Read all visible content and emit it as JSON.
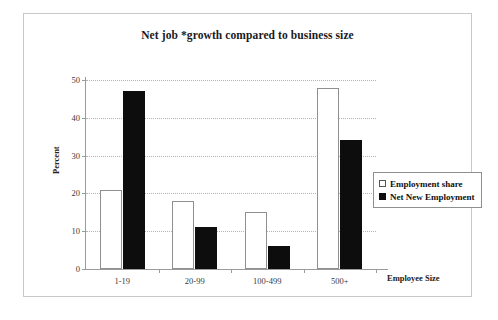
{
  "chart_data": {
    "type": "bar",
    "title": "Net job *growth compared to business size",
    "xlabel": "Employee Size",
    "ylabel": "Percent",
    "categories": [
      "1-19",
      "20-99",
      "100-499",
      "500+"
    ],
    "series": [
      {
        "name": "Employment share",
        "values": [
          21,
          18,
          15,
          48
        ],
        "color": "#ffffff"
      },
      {
        "name": "Net New Employment",
        "values": [
          47,
          11,
          6,
          34
        ],
        "color": "#0d0d0d"
      }
    ],
    "ylim": [
      0,
      50
    ],
    "yticks": [
      0,
      10,
      20,
      30,
      40,
      50
    ],
    "ytick_labels": [
      "0",
      "10",
      "20",
      "30",
      "40",
      "50"
    ],
    "grid": true,
    "legend_position": "right-center"
  },
  "legend": {
    "items": [
      {
        "label": "Employment share",
        "swatch": "hollow-square-icon"
      },
      {
        "label": "Net New Employment",
        "swatch": "filled-square-icon"
      }
    ]
  }
}
